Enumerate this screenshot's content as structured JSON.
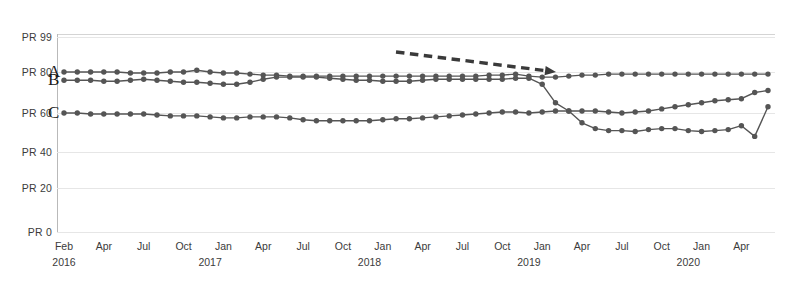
{
  "chart_data": {
    "type": "line",
    "title": "",
    "subtitle": "",
    "xlabel": "",
    "ylabel": "",
    "grid": true,
    "legend_position": "inline-left",
    "y_tick_labels": [
      "PR 99",
      "PR 80",
      "PR 60",
      "PR 40",
      "PR 20",
      "PR 0"
    ],
    "y_tick_values": [
      99,
      80,
      60,
      40,
      20,
      0
    ],
    "ylim": [
      0,
      99
    ],
    "y_scale": "percentile-rank",
    "x_tick_labels": [
      "Feb",
      "Apr",
      "Jul",
      "Oct",
      "Jan",
      "Apr",
      "Jul",
      "Oct",
      "Jan",
      "Apr",
      "Jul",
      "Oct",
      "Jan",
      "Apr",
      "Jul",
      "Oct",
      "Jan",
      "Apr",
      "Jul"
    ],
    "x_year_labels": [
      {
        "label": "2016",
        "at": "Feb"
      },
      {
        "label": "2017",
        "at": "Jan"
      },
      {
        "label": "2018",
        "at": "Jan"
      },
      {
        "label": "2019",
        "at": "Jan"
      },
      {
        "label": "2020",
        "at": "Jan"
      }
    ],
    "x": [
      "2016-02",
      "2016-03",
      "2016-04",
      "2016-05",
      "2016-06",
      "2016-07",
      "2016-08",
      "2016-09",
      "2016-10",
      "2016-11",
      "2016-12",
      "2017-01",
      "2017-02",
      "2017-03",
      "2017-04",
      "2017-05",
      "2017-06",
      "2017-07",
      "2017-08",
      "2017-09",
      "2017-10",
      "2017-11",
      "2017-12",
      "2018-01",
      "2018-02",
      "2018-03",
      "2018-04",
      "2018-05",
      "2018-06",
      "2018-07",
      "2018-08",
      "2018-09",
      "2018-10",
      "2018-11",
      "2018-12",
      "2019-01",
      "2019-02",
      "2019-03",
      "2019-04",
      "2019-05",
      "2019-06",
      "2019-07",
      "2019-08",
      "2019-09",
      "2019-10",
      "2019-11",
      "2019-12",
      "2020-01",
      "2020-02",
      "2020-03",
      "2020-04",
      "2020-05",
      "2020-06",
      "2020-07"
    ],
    "series": [
      {
        "name": "A",
        "label": "A",
        "color": "#555555",
        "values": [
          80,
          80,
          80,
          80,
          80,
          79.5,
          79.5,
          79.5,
          80,
          80,
          81,
          80,
          79.5,
          79.5,
          79,
          78.5,
          78.5,
          78,
          78,
          78,
          78,
          78,
          78,
          78,
          78,
          78,
          78,
          78,
          78,
          78,
          78,
          78,
          78.5,
          78.5,
          79,
          78,
          77.5,
          77.5,
          78,
          78.5,
          78.5,
          79,
          79,
          79,
          79,
          79,
          79,
          79,
          79,
          79,
          79,
          79,
          79,
          79
        ]
      },
      {
        "name": "B",
        "label": "B",
        "color": "#555555",
        "values": [
          76,
          76,
          76,
          75.5,
          75.5,
          76,
          76.5,
          76,
          75.5,
          75,
          75,
          74.5,
          74,
          74,
          75,
          76.5,
          77.5,
          77.5,
          77.5,
          77.5,
          77,
          76.5,
          76,
          76,
          75.5,
          75.5,
          75.5,
          76,
          76.5,
          76.5,
          76.5,
          76.5,
          76.5,
          76.5,
          77,
          77,
          74,
          65,
          61,
          61,
          61,
          60.5,
          60,
          60.5,
          61,
          62,
          63,
          64,
          65,
          66,
          66.5,
          67,
          70,
          71
        ]
      },
      {
        "name": "C",
        "label": "C",
        "color": "#555555",
        "values": [
          60,
          60,
          59.5,
          59.5,
          59.5,
          59.5,
          59.5,
          59,
          58.5,
          58.5,
          58.5,
          58,
          57.5,
          57.5,
          58,
          58,
          58,
          57.5,
          56.5,
          56,
          56,
          56,
          56,
          56,
          56.5,
          57,
          57,
          57.5,
          58,
          58.5,
          59,
          59.5,
          60,
          60.5,
          60.5,
          60,
          60.5,
          61,
          61,
          55,
          52,
          51,
          51,
          50.5,
          51.5,
          52,
          52,
          51,
          50.5,
          51,
          51.5,
          53.5,
          48,
          63
        ]
      }
    ],
    "annotations": [
      {
        "type": "dashed-arrow",
        "direction": "right-down",
        "x1": 396,
        "y1": 52,
        "x2": 556,
        "y2": 72,
        "color": "#3a3a3a"
      }
    ]
  },
  "plot_area": {
    "left": 57,
    "top": 34,
    "right": 775,
    "bottom": 233
  }
}
